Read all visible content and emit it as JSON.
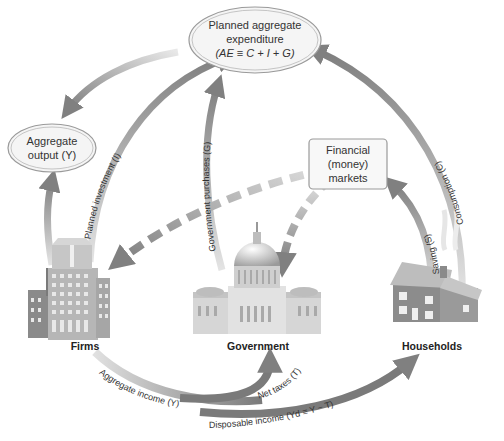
{
  "diagram": {
    "nodes": {
      "planned_aggregate_expenditure": {
        "line1": "Planned aggregate",
        "line2": "expenditure",
        "line3": "(AE ≡ C + I + G)"
      },
      "aggregate_output": {
        "line1": "Aggregate",
        "line2": "output (Y)"
      },
      "financial_markets": {
        "line1": "Financial",
        "line2": "(money)",
        "line3": "markets"
      },
      "firms": {
        "label": "Firms"
      },
      "government": {
        "label": "Government"
      },
      "households": {
        "label": "Households"
      }
    },
    "flows": {
      "consumption": "Consumption (C)",
      "saving": "Saving (S)",
      "planned_investment": "Planned investment (I)",
      "government_purchases": "Government purchases (G)",
      "aggregate_income": "Aggregate income (Y)",
      "net_taxes": "Net taxes (T)",
      "disposable_income": "Disposable income (Yd ≡ Y − T)"
    },
    "colors": {
      "arrow": "#8a8a8a",
      "arrow_light": "#d8d8d8",
      "dashed_arrow": "#8c8c8c",
      "ellipse_fill": "#f4f4f4",
      "ellipse_stroke": "#9a9a9a"
    }
  }
}
